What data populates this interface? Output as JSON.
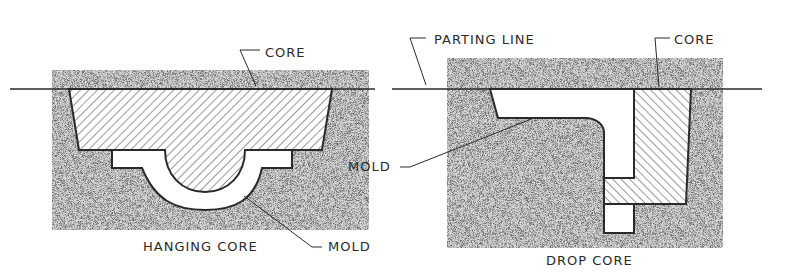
{
  "figure": {
    "left": {
      "caption": "HANGING CORE",
      "labels": {
        "core": "CORE",
        "mold": "MOLD"
      }
    },
    "right": {
      "caption": "DROP CORE",
      "labels": {
        "parting_line": "PARTING LINE",
        "core": "CORE",
        "mold": "MOLD"
      }
    }
  },
  "colors": {
    "line": "#2a2a2a",
    "sand": "#c9c9c9",
    "background": "#ffffff"
  }
}
